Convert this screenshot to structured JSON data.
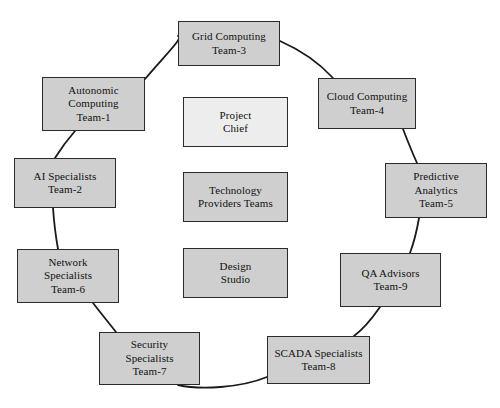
{
  "diagram": {
    "type": "ring-network-diagram",
    "node_fill": "#cfcfcf",
    "node_fill_light": "#ededed",
    "node_border": "#2b2b2b",
    "link_color": "#1a1a1a",
    "background": "#ffffff",
    "ring_nodes": [
      {
        "id": "grid-computing",
        "label": "Grid Computing\nTeam-3",
        "x": 178,
        "y": 21,
        "w": 102,
        "h": 45,
        "shade": "dark"
      },
      {
        "id": "cloud-computing",
        "label": "Cloud Computing\nTeam-4",
        "x": 318,
        "y": 78,
        "w": 98,
        "h": 51,
        "shade": "dark"
      },
      {
        "id": "predictive-analytics",
        "label": "Predictive\nAnalytics\nTeam-5",
        "x": 385,
        "y": 163,
        "w": 102,
        "h": 55,
        "shade": "dark"
      },
      {
        "id": "qa-advisors",
        "label": "QA Advisors\nTeam-9",
        "x": 340,
        "y": 253,
        "w": 101,
        "h": 54,
        "shade": "dark"
      },
      {
        "id": "scada-specialists",
        "label": "SCADA  Specialists\nTeam-8",
        "x": 267,
        "y": 336,
        "w": 103,
        "h": 48,
        "shade": "dark"
      },
      {
        "id": "security-specialists",
        "label": "Security\nSpecialists\nTeam-7",
        "x": 99,
        "y": 332,
        "w": 101,
        "h": 53,
        "shade": "dark"
      },
      {
        "id": "network-specialists",
        "label": "Network\nSpecialists\nTeam-6",
        "x": 17,
        "y": 249,
        "w": 102,
        "h": 54,
        "shade": "dark"
      },
      {
        "id": "ai-specialists",
        "label": "AI Specialists\nTeam-2",
        "x": 14,
        "y": 158,
        "w": 102,
        "h": 50,
        "shade": "dark"
      },
      {
        "id": "autonomic-computing",
        "label": "Autonomic\nComputing\nTeam-1",
        "x": 42,
        "y": 77,
        "w": 103,
        "h": 54,
        "shade": "dark"
      }
    ],
    "center_nodes": [
      {
        "id": "project-chief",
        "label": "Project\nChief",
        "x": 183,
        "y": 97,
        "w": 105,
        "h": 50,
        "shade": "light"
      },
      {
        "id": "technology-providers-teams",
        "label": "Technology\nProviders Teams",
        "x": 183,
        "y": 172,
        "w": 105,
        "h": 50,
        "shade": "dark"
      },
      {
        "id": "design-studio",
        "label": "Design\nStudio",
        "x": 183,
        "y": 248,
        "w": 105,
        "h": 50,
        "shade": "dark"
      }
    ],
    "links": [
      {
        "id": "link-autonomic-grid",
        "from": "autonomic-computing",
        "to": "grid-computing",
        "path": "M 145 79 C 168 52 184 37 178 36"
      },
      {
        "id": "link-grid-cloud",
        "from": "grid-computing",
        "to": "cloud-computing",
        "path": "M 280 41 C 305 52 322 66 333 78"
      },
      {
        "id": "link-cloud-predictive",
        "from": "cloud-computing",
        "to": "predictive-analytics",
        "path": "M 403 129 C 408 142 412 152 417 163"
      },
      {
        "id": "link-predictive-qa",
        "from": "predictive-analytics",
        "to": "qa-advisors",
        "path": "M 419 218 C 417 230 414 242 410 253"
      },
      {
        "id": "link-qa-scada",
        "from": "qa-advisors",
        "to": "scada-specialists",
        "path": "M 380 307 C 371 320 362 330 354 336"
      },
      {
        "id": "link-scada-security",
        "from": "scada-specialists",
        "to": "security-specialists",
        "path": "M 267 377 C 240 388 200 390 178 385"
      },
      {
        "id": "link-security-network",
        "from": "security-specialists",
        "to": "network-specialists",
        "path": "M 116 332 C 108 322 100 312 93 303"
      },
      {
        "id": "link-network-ai",
        "from": "network-specialists",
        "to": "ai-specialists",
        "path": "M 58 249 C 56 238 54 222 53 208"
      },
      {
        "id": "link-ai-autonomic",
        "from": "ai-specialists",
        "to": "autonomic-computing",
        "path": "M 55 158 C 60 150 68 139 75 131"
      }
    ]
  }
}
